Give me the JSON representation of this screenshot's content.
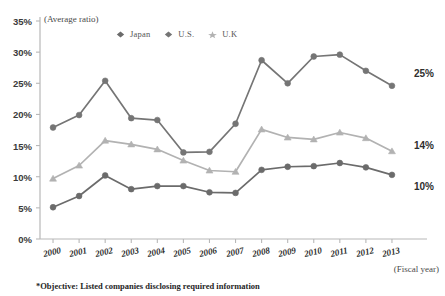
{
  "chart_data": {
    "type": "line",
    "title": "",
    "subtitle": "",
    "xlabel": "(Fiscal year)",
    "ylabel": "(Average ratio)",
    "categories": [
      "2000",
      "2001",
      "2002",
      "2003",
      "2004",
      "2005",
      "2006",
      "2007",
      "2008",
      "2009",
      "2010",
      "2011",
      "2012",
      "2013"
    ],
    "ylim": [
      0,
      35
    ],
    "ytick_step": 5,
    "ytick_labels": [
      "0%",
      "5%",
      "10%",
      "15%",
      "20%",
      "25%",
      "30%",
      "35%"
    ],
    "grid": false,
    "legend_position": "top-center",
    "series": [
      {
        "name": "Japan",
        "color": "#6b6b6b",
        "marker": "circle",
        "values": [
          5.1,
          6.9,
          10.2,
          8.0,
          8.5,
          8.5,
          7.5,
          7.4,
          11.1,
          11.6,
          11.7,
          12.2,
          11.5,
          10.3
        ],
        "end_label": "10%"
      },
      {
        "name": "U.S.",
        "color": "#757575",
        "marker": "circle",
        "values": [
          17.9,
          19.9,
          25.4,
          19.4,
          19.1,
          13.9,
          14.0,
          18.5,
          28.7,
          25.0,
          29.3,
          29.6,
          27.0,
          24.6
        ],
        "end_label": "25%"
      },
      {
        "name": "U.K",
        "color": "#b2b2b2",
        "marker": "triangle",
        "values": [
          9.7,
          11.8,
          15.8,
          15.2,
          14.4,
          12.6,
          11.0,
          10.8,
          17.6,
          16.3,
          16.0,
          17.1,
          16.2,
          14.1
        ],
        "end_label": "14%"
      }
    ],
    "annotations": [
      {
        "text": "25%",
        "series": "U.S.",
        "at": "2013"
      },
      {
        "text": "14%",
        "series": "U.K",
        "at": "2013"
      },
      {
        "text": "10%",
        "series": "Japan",
        "at": "2013"
      }
    ],
    "footnote": "*Objective: Listed companies disclosing required information"
  },
  "legend": {
    "items": [
      {
        "label": "Japan",
        "marker": "diamond-marker",
        "color": "#6b6b6b"
      },
      {
        "label": "U.S.",
        "marker": "diamond-marker",
        "color": "#757575"
      },
      {
        "label": "U.K",
        "marker": "star-marker",
        "color": "#b2b2b2"
      }
    ]
  },
  "colors": {
    "axis": "#b8b8b8",
    "text": "#2e2e2e",
    "japan": "#6b6b6b",
    "us": "#757575",
    "uk": "#b2b2b2"
  }
}
